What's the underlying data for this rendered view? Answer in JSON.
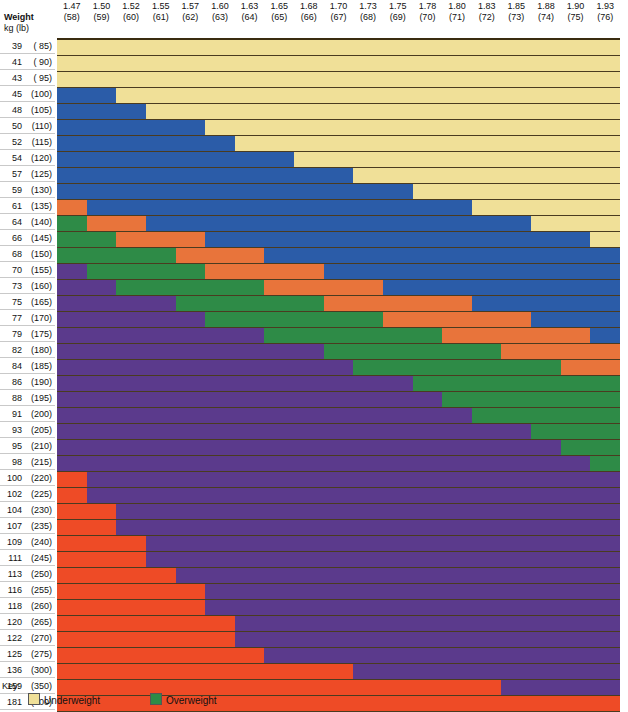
{
  "header": {
    "weight_label": "Weight",
    "weight_sub": "kg (lb)",
    "columns": [
      {
        "m": "1.47",
        "inch": "(58)"
      },
      {
        "m": "1.50",
        "inch": "(59)"
      },
      {
        "m": "1.52",
        "inch": "(60)"
      },
      {
        "m": "1.55",
        "inch": "(61)"
      },
      {
        "m": "1.57",
        "inch": "(62)"
      },
      {
        "m": "1.60",
        "inch": "(63)"
      },
      {
        "m": "1.63",
        "inch": "(64)"
      },
      {
        "m": "1.65",
        "inch": "(65)"
      },
      {
        "m": "1.68",
        "inch": "(66)"
      },
      {
        "m": "1.70",
        "inch": "(67)"
      },
      {
        "m": "1.73",
        "inch": "(68)"
      },
      {
        "m": "1.75",
        "inch": "(69)"
      },
      {
        "m": "1.78",
        "inch": "(70)"
      },
      {
        "m": "1.80",
        "inch": "(71)"
      },
      {
        "m": "1.83",
        "inch": "(72)"
      },
      {
        "m": "1.85",
        "inch": "(73)"
      },
      {
        "m": "1.88",
        "inch": "(74)"
      },
      {
        "m": "1.90",
        "inch": "(75)"
      },
      {
        "m": "1.93",
        "inch": "(76)"
      }
    ]
  },
  "key": {
    "title": "Key:",
    "items": [
      {
        "label": "Underweight",
        "color": "#F0E098"
      },
      {
        "label": "Overweight",
        "color": "#2E8B47"
      }
    ]
  },
  "colors": {
    "underweight": "#F0E098",
    "normal": "#2B5CA8",
    "band_orange": "#E8743B",
    "overweight": "#2E8B47",
    "obese": "#5B3A8C",
    "severe_obese": "#EE4B26",
    "grid_line": "#4a3b20",
    "frame": "#3a2c10"
  },
  "chart_data": {
    "type": "heatmap",
    "xlabel": "Height m (in)",
    "ylabel": "Weight kg (lb)",
    "grid": true,
    "legend_position": "bottom-left",
    "categories_x": [
      "1.47 (58)",
      "1.50 (59)",
      "1.52 (60)",
      "1.55 (61)",
      "1.57 (62)",
      "1.60 (63)",
      "1.63 (64)",
      "1.65 (65)",
      "1.68 (66)",
      "1.70 (67)",
      "1.73 (68)",
      "1.75 (69)",
      "1.78 (70)",
      "1.80 (71)",
      "1.83 (72)",
      "1.85 (73)",
      "1.88 (74)",
      "1.90 (75)",
      "1.93 (76)"
    ],
    "categories_y": [
      "39 ( 85)",
      "41 ( 90)",
      "43 ( 95)",
      "45 (100)",
      "48 (105)",
      "50 (110)",
      "52 (115)",
      "54 (120)",
      "57 (125)",
      "59 (130)",
      "61 (135)",
      "64 (140)",
      "66 (145)",
      "68 (150)",
      "70 (155)",
      "73 (160)",
      "75 (165)",
      "77 (170)",
      "79 (175)",
      "82 (180)",
      "84 (185)",
      "86 (190)",
      "88 (195)",
      "91 (200)",
      "93 (205)",
      "95 (210)",
      "98 (215)",
      "100 (220)",
      "102 (225)",
      "104 (230)",
      "107 (235)",
      "109 (240)",
      "111 (245)",
      "113 (250)",
      "116 (255)",
      "118 (260)",
      "120 (265)",
      "122 (270)",
      "125 (275)",
      "136 (300)",
      "159 (350)",
      "181 (400)"
    ],
    "category_colors": {
      "0": "#F0E098",
      "1": "#2B5CA8",
      "2": "#E8743B",
      "3": "#2E8B47",
      "4": "#5B3A8C",
      "5": "#EE4B26"
    },
    "category_names": {
      "0": "Underweight",
      "1": "Normal",
      "2": "Upper normal band",
      "3": "Overweight",
      "4": "Obese",
      "5": "Severely obese"
    },
    "rows": [
      {
        "label": "39 ( 85)",
        "kg": 39,
        "lb": 85,
        "cells": [
          0,
          0,
          0,
          0,
          0,
          0,
          0,
          0,
          0,
          0,
          0,
          0,
          0,
          0,
          0,
          0,
          0,
          0,
          0
        ]
      },
      {
        "label": "41 ( 90)",
        "kg": 41,
        "lb": 90,
        "cells": [
          0,
          0,
          0,
          0,
          0,
          0,
          0,
          0,
          0,
          0,
          0,
          0,
          0,
          0,
          0,
          0,
          0,
          0,
          0
        ]
      },
      {
        "label": "43 ( 95)",
        "kg": 43,
        "lb": 95,
        "cells": [
          0,
          0,
          0,
          0,
          0,
          0,
          0,
          0,
          0,
          0,
          0,
          0,
          0,
          0,
          0,
          0,
          0,
          0,
          0
        ]
      },
      {
        "label": "45 (100)",
        "kg": 45,
        "lb": 100,
        "cells": [
          1,
          1,
          0,
          0,
          0,
          0,
          0,
          0,
          0,
          0,
          0,
          0,
          0,
          0,
          0,
          0,
          0,
          0,
          0
        ]
      },
      {
        "label": "48 (105)",
        "kg": 48,
        "lb": 105,
        "cells": [
          1,
          1,
          1,
          0,
          0,
          0,
          0,
          0,
          0,
          0,
          0,
          0,
          0,
          0,
          0,
          0,
          0,
          0,
          0
        ]
      },
      {
        "label": "50 (110)",
        "kg": 50,
        "lb": 110,
        "cells": [
          1,
          1,
          1,
          1,
          1,
          0,
          0,
          0,
          0,
          0,
          0,
          0,
          0,
          0,
          0,
          0,
          0,
          0,
          0
        ]
      },
      {
        "label": "52 (115)",
        "kg": 52,
        "lb": 115,
        "cells": [
          1,
          1,
          1,
          1,
          1,
          1,
          0,
          0,
          0,
          0,
          0,
          0,
          0,
          0,
          0,
          0,
          0,
          0,
          0
        ]
      },
      {
        "label": "54 (120)",
        "kg": 54,
        "lb": 120,
        "cells": [
          1,
          1,
          1,
          1,
          1,
          1,
          1,
          1,
          0,
          0,
          0,
          0,
          0,
          0,
          0,
          0,
          0,
          0,
          0
        ]
      },
      {
        "label": "57 (125)",
        "kg": 57,
        "lb": 125,
        "cells": [
          1,
          1,
          1,
          1,
          1,
          1,
          1,
          1,
          1,
          1,
          0,
          0,
          0,
          0,
          0,
          0,
          0,
          0,
          0
        ]
      },
      {
        "label": "59 (130)",
        "kg": 59,
        "lb": 130,
        "cells": [
          1,
          1,
          1,
          1,
          1,
          1,
          1,
          1,
          1,
          1,
          1,
          1,
          0,
          0,
          0,
          0,
          0,
          0,
          0
        ]
      },
      {
        "label": "61 (135)",
        "kg": 61,
        "lb": 135,
        "cells": [
          2,
          1,
          1,
          1,
          1,
          1,
          1,
          1,
          1,
          1,
          1,
          1,
          1,
          1,
          0,
          0,
          0,
          0,
          0
        ]
      },
      {
        "label": "64 (140)",
        "kg": 64,
        "lb": 140,
        "cells": [
          3,
          2,
          2,
          1,
          1,
          1,
          1,
          1,
          1,
          1,
          1,
          1,
          1,
          1,
          1,
          1,
          0,
          0,
          0
        ]
      },
      {
        "label": "66 (145)",
        "kg": 66,
        "lb": 145,
        "cells": [
          3,
          3,
          2,
          2,
          2,
          1,
          1,
          1,
          1,
          1,
          1,
          1,
          1,
          1,
          1,
          1,
          1,
          1,
          0
        ]
      },
      {
        "label": "68 (150)",
        "kg": 68,
        "lb": 150,
        "cells": [
          3,
          3,
          3,
          3,
          2,
          2,
          2,
          1,
          1,
          1,
          1,
          1,
          1,
          1,
          1,
          1,
          1,
          1,
          1
        ]
      },
      {
        "label": "70 (155)",
        "kg": 70,
        "lb": 155,
        "cells": [
          4,
          3,
          3,
          3,
          3,
          2,
          2,
          2,
          2,
          1,
          1,
          1,
          1,
          1,
          1,
          1,
          1,
          1,
          1
        ]
      },
      {
        "label": "73 (160)",
        "kg": 73,
        "lb": 160,
        "cells": [
          4,
          4,
          3,
          3,
          3,
          3,
          3,
          2,
          2,
          2,
          2,
          1,
          1,
          1,
          1,
          1,
          1,
          1,
          1
        ]
      },
      {
        "label": "75 (165)",
        "kg": 75,
        "lb": 165,
        "cells": [
          4,
          4,
          4,
          4,
          3,
          3,
          3,
          3,
          3,
          2,
          2,
          2,
          2,
          2,
          1,
          1,
          1,
          1,
          1
        ]
      },
      {
        "label": "77 (170)",
        "kg": 77,
        "lb": 170,
        "cells": [
          4,
          4,
          4,
          4,
          4,
          3,
          3,
          3,
          3,
          3,
          3,
          2,
          2,
          2,
          2,
          2,
          1,
          1,
          1
        ]
      },
      {
        "label": "79 (175)",
        "kg": 79,
        "lb": 175,
        "cells": [
          4,
          4,
          4,
          4,
          4,
          4,
          4,
          3,
          3,
          3,
          3,
          3,
          3,
          2,
          2,
          2,
          2,
          2,
          1
        ]
      },
      {
        "label": "82 (180)",
        "kg": 82,
        "lb": 180,
        "cells": [
          4,
          4,
          4,
          4,
          4,
          4,
          4,
          4,
          4,
          3,
          3,
          3,
          3,
          3,
          3,
          2,
          2,
          2,
          2
        ]
      },
      {
        "label": "84 (185)",
        "kg": 84,
        "lb": 185,
        "cells": [
          4,
          4,
          4,
          4,
          4,
          4,
          4,
          4,
          4,
          4,
          3,
          3,
          3,
          3,
          3,
          3,
          3,
          2,
          2
        ]
      },
      {
        "label": "86 (190)",
        "kg": 86,
        "lb": 190,
        "cells": [
          4,
          4,
          4,
          4,
          4,
          4,
          4,
          4,
          4,
          4,
          4,
          4,
          3,
          3,
          3,
          3,
          3,
          3,
          3
        ]
      },
      {
        "label": "88 (195)",
        "kg": 88,
        "lb": 195,
        "cells": [
          4,
          4,
          4,
          4,
          4,
          4,
          4,
          4,
          4,
          4,
          4,
          4,
          4,
          3,
          3,
          3,
          3,
          3,
          3
        ]
      },
      {
        "label": "91 (200)",
        "kg": 91,
        "lb": 200,
        "cells": [
          4,
          4,
          4,
          4,
          4,
          4,
          4,
          4,
          4,
          4,
          4,
          4,
          4,
          4,
          3,
          3,
          3,
          3,
          3
        ]
      },
      {
        "label": "93 (205)",
        "kg": 93,
        "lb": 205,
        "cells": [
          4,
          4,
          4,
          4,
          4,
          4,
          4,
          4,
          4,
          4,
          4,
          4,
          4,
          4,
          4,
          4,
          3,
          3,
          3
        ]
      },
      {
        "label": "95 (210)",
        "kg": 95,
        "lb": 210,
        "cells": [
          4,
          4,
          4,
          4,
          4,
          4,
          4,
          4,
          4,
          4,
          4,
          4,
          4,
          4,
          4,
          4,
          4,
          3,
          3
        ]
      },
      {
        "label": "98 (215)",
        "kg": 98,
        "lb": 215,
        "cells": [
          4,
          4,
          4,
          4,
          4,
          4,
          4,
          4,
          4,
          4,
          4,
          4,
          4,
          4,
          4,
          4,
          4,
          4,
          3
        ]
      },
      {
        "label": "100 (220)",
        "kg": 100,
        "lb": 220,
        "cells": [
          5,
          4,
          4,
          4,
          4,
          4,
          4,
          4,
          4,
          4,
          4,
          4,
          4,
          4,
          4,
          4,
          4,
          4,
          4
        ]
      },
      {
        "label": "102 (225)",
        "kg": 102,
        "lb": 225,
        "cells": [
          5,
          4,
          4,
          4,
          4,
          4,
          4,
          4,
          4,
          4,
          4,
          4,
          4,
          4,
          4,
          4,
          4,
          4,
          4
        ]
      },
      {
        "label": "104 (230)",
        "kg": 104,
        "lb": 230,
        "cells": [
          5,
          5,
          4,
          4,
          4,
          4,
          4,
          4,
          4,
          4,
          4,
          4,
          4,
          4,
          4,
          4,
          4,
          4,
          4
        ]
      },
      {
        "label": "107 (235)",
        "kg": 107,
        "lb": 235,
        "cells": [
          5,
          5,
          4,
          4,
          4,
          4,
          4,
          4,
          4,
          4,
          4,
          4,
          4,
          4,
          4,
          4,
          4,
          4,
          4
        ]
      },
      {
        "label": "109 (240)",
        "kg": 109,
        "lb": 240,
        "cells": [
          5,
          5,
          5,
          4,
          4,
          4,
          4,
          4,
          4,
          4,
          4,
          4,
          4,
          4,
          4,
          4,
          4,
          4,
          4
        ]
      },
      {
        "label": "111 (245)",
        "kg": 111,
        "lb": 245,
        "cells": [
          5,
          5,
          5,
          4,
          4,
          4,
          4,
          4,
          4,
          4,
          4,
          4,
          4,
          4,
          4,
          4,
          4,
          4,
          4
        ]
      },
      {
        "label": "113 (250)",
        "kg": 113,
        "lb": 250,
        "cells": [
          5,
          5,
          5,
          5,
          4,
          4,
          4,
          4,
          4,
          4,
          4,
          4,
          4,
          4,
          4,
          4,
          4,
          4,
          4
        ]
      },
      {
        "label": "116 (255)",
        "kg": 116,
        "lb": 255,
        "cells": [
          5,
          5,
          5,
          5,
          5,
          4,
          4,
          4,
          4,
          4,
          4,
          4,
          4,
          4,
          4,
          4,
          4,
          4,
          4
        ]
      },
      {
        "label": "118 (260)",
        "kg": 118,
        "lb": 260,
        "cells": [
          5,
          5,
          5,
          5,
          5,
          4,
          4,
          4,
          4,
          4,
          4,
          4,
          4,
          4,
          4,
          4,
          4,
          4,
          4
        ]
      },
      {
        "label": "120 (265)",
        "kg": 120,
        "lb": 265,
        "cells": [
          5,
          5,
          5,
          5,
          5,
          5,
          4,
          4,
          4,
          4,
          4,
          4,
          4,
          4,
          4,
          4,
          4,
          4,
          4
        ]
      },
      {
        "label": "122 (270)",
        "kg": 122,
        "lb": 270,
        "cells": [
          5,
          5,
          5,
          5,
          5,
          5,
          4,
          4,
          4,
          4,
          4,
          4,
          4,
          4,
          4,
          4,
          4,
          4,
          4
        ]
      },
      {
        "label": "125 (275)",
        "kg": 125,
        "lb": 275,
        "cells": [
          5,
          5,
          5,
          5,
          5,
          5,
          5,
          4,
          4,
          4,
          4,
          4,
          4,
          4,
          4,
          4,
          4,
          4,
          4
        ]
      },
      {
        "label": "136 (300)",
        "kg": 136,
        "lb": 300,
        "cells": [
          5,
          5,
          5,
          5,
          5,
          5,
          5,
          5,
          5,
          5,
          4,
          4,
          4,
          4,
          4,
          4,
          4,
          4,
          4
        ]
      },
      {
        "label": "159 (350)",
        "kg": 159,
        "lb": 350,
        "cells": [
          5,
          5,
          5,
          5,
          5,
          5,
          5,
          5,
          5,
          5,
          5,
          5,
          5,
          5,
          5,
          4,
          4,
          4,
          4
        ]
      },
      {
        "label": "181 (400)",
        "kg": 181,
        "lb": 400,
        "cells": [
          5,
          5,
          5,
          5,
          5,
          5,
          5,
          5,
          5,
          5,
          5,
          5,
          5,
          5,
          5,
          5,
          5,
          5,
          5
        ]
      }
    ]
  }
}
